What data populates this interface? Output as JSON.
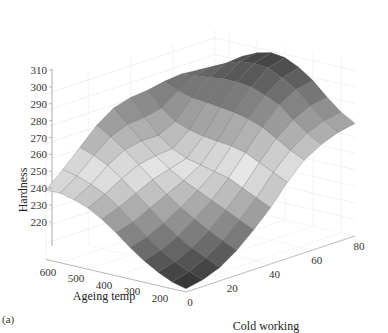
{
  "chart_data": {
    "type": "surface",
    "title": "",
    "panel_label": "(a)",
    "xlabel": "Cold working",
    "ylabel": "Ageing temp",
    "zlabel": "Hardness",
    "x_ticks": [
      0,
      20,
      40,
      60,
      80
    ],
    "y_ticks": [
      200,
      300,
      400,
      500,
      600
    ],
    "z_ticks": [
      220,
      230,
      240,
      250,
      260,
      270,
      280,
      290,
      300,
      310
    ],
    "xlim": [
      0,
      80
    ],
    "ylim": [
      150,
      650
    ],
    "zlim": [
      210,
      315
    ],
    "grid": true,
    "colormap": "gray",
    "x": [
      0,
      8,
      16,
      24,
      32,
      40,
      48,
      56,
      64,
      72,
      80
    ],
    "y": [
      150,
      200,
      250,
      300,
      350,
      400,
      450,
      500,
      550,
      600,
      650
    ],
    "z": [
      [
        212,
        214,
        218,
        225,
        234,
        244,
        256,
        266,
        272,
        276,
        278
      ],
      [
        214,
        217,
        222,
        229,
        238,
        248,
        260,
        270,
        277,
        281,
        283
      ],
      [
        218,
        221,
        226,
        233,
        242,
        252,
        264,
        275,
        283,
        288,
        290
      ],
      [
        223,
        226,
        231,
        238,
        246,
        256,
        268,
        280,
        290,
        296,
        298
      ],
      [
        229,
        232,
        237,
        243,
        250,
        258,
        270,
        283,
        294,
        301,
        304
      ],
      [
        236,
        239,
        244,
        249,
        254,
        260,
        271,
        285,
        297,
        305,
        308
      ],
      [
        242,
        246,
        251,
        256,
        259,
        262,
        272,
        286,
        298,
        306,
        309
      ],
      [
        247,
        252,
        258,
        263,
        265,
        266,
        274,
        287,
        298,
        305,
        307
      ],
      [
        250,
        256,
        264,
        270,
        272,
        272,
        277,
        288,
        297,
        302,
        303
      ],
      [
        252,
        259,
        268,
        276,
        280,
        281,
        283,
        290,
        296,
        298,
        297
      ],
      [
        252,
        261,
        271,
        281,
        288,
        291,
        292,
        294,
        295,
        294,
        292
      ]
    ]
  }
}
